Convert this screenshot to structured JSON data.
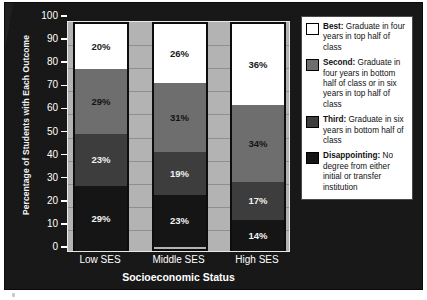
{
  "chart_data": {
    "type": "bar",
    "subtype": "stacked-bar-vertical",
    "title": "",
    "xlabel": "Socioeconomic Status",
    "ylabel": "Percentage of Students with Each Outcome",
    "categories": [
      "Low SES",
      "Middle SES",
      "High SES"
    ],
    "ylim": [
      0,
      100
    ],
    "yticks": [
      0,
      10,
      20,
      30,
      40,
      50,
      60,
      70,
      80,
      90,
      100
    ],
    "ytick_labels": [
      "0",
      "10",
      "20",
      "30",
      "40",
      "50",
      "60",
      "70",
      "80",
      "90",
      "100"
    ],
    "grid": "horizontal",
    "legend_position": "right-outside",
    "stack_order_bottom_to_top": [
      "Disappointing",
      "Third",
      "Second",
      "Best"
    ],
    "series": [
      {
        "name": "Disappointing",
        "color": "#151515",
        "values": [
          29,
          23,
          14
        ],
        "data_labels": [
          "29%",
          "23%",
          "14%"
        ]
      },
      {
        "name": "Third",
        "color": "#3d3d3d",
        "values": [
          23,
          19,
          17
        ],
        "data_labels": [
          "23%",
          "19%",
          "17%"
        ]
      },
      {
        "name": "Second",
        "color": "#6e6e6e",
        "values": [
          29,
          31,
          34
        ],
        "data_labels": [
          "29%",
          "31%",
          "34%"
        ]
      },
      {
        "name": "Best",
        "color": "#ffffff",
        "values": [
          20,
          26,
          36
        ],
        "data_labels": [
          "20%",
          "26%",
          "36%"
        ]
      }
    ],
    "legend": [
      {
        "key": "best",
        "swatch_color": "#ffffff",
        "name": "Best:",
        "description": " Graduate in four years in top half of class"
      },
      {
        "key": "second",
        "swatch_color": "#6e6e6e",
        "name": "Second:",
        "description": " Graduate in four years in bottom half of class or in six years in top half of class"
      },
      {
        "key": "third",
        "swatch_color": "#3d3d3d",
        "name": "Third:",
        "description": " Graduate in six years in bottom half of class"
      },
      {
        "key": "disappointing",
        "swatch_color": "#151515",
        "name": "Disappointing:",
        "description": " No degree from either initial or transfer institution"
      }
    ],
    "colors": {
      "figure_background": "#131313",
      "plot_background": "#b3b3b3",
      "gridline": "#8f8f8f",
      "axis_text": "#ffffff",
      "bar_outline": "#0d0d0d",
      "legend_background": "#ffffff",
      "legend_border": "#4a4a4a"
    }
  }
}
